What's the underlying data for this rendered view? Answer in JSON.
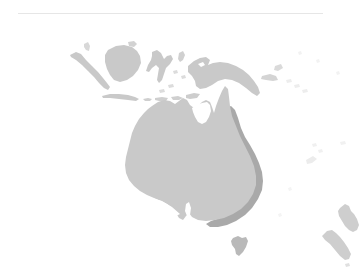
{
  "page": {
    "background_color": "#ffffff",
    "divider": {
      "color": "#e6e6e6",
      "label": ""
    }
  },
  "map": {
    "title": "",
    "caption": "",
    "region_name": "Oceania",
    "projection_note": "",
    "colors": {
      "land_fill": "#c9c9c9",
      "highlight_fill": "#a9a9a9",
      "faint_fill": "#ededed",
      "ocean": "#ffffff"
    },
    "legend": {
      "visible": false,
      "entries": [
        {
          "label": "",
          "color": "#c9c9c9"
        },
        {
          "label": "",
          "color": "#a9a9a9"
        }
      ]
    },
    "landmasses": [
      {
        "name": "Sumatra",
        "label": "",
        "fill": "land"
      },
      {
        "name": "Borneo",
        "label": "",
        "fill": "land"
      },
      {
        "name": "Java",
        "label": "",
        "fill": "land"
      },
      {
        "name": "Sulawesi",
        "label": "",
        "fill": "land"
      },
      {
        "name": "Lesser Sunda Islands",
        "label": "",
        "fill": "land"
      },
      {
        "name": "New Guinea",
        "label": "",
        "fill": "land"
      },
      {
        "name": "Australia",
        "label": "",
        "fill": "land"
      },
      {
        "name": "Eastern Seaboard Highlight",
        "label": "",
        "fill": "highlight"
      },
      {
        "name": "Tasmania",
        "label": "",
        "fill": "land"
      },
      {
        "name": "New Zealand North Island",
        "label": "",
        "fill": "land"
      },
      {
        "name": "New Zealand South Island",
        "label": "",
        "fill": "land"
      },
      {
        "name": "Solomon Islands",
        "label": "",
        "fill": "faint"
      },
      {
        "name": "New Caledonia",
        "label": "",
        "fill": "faint"
      }
    ]
  }
}
